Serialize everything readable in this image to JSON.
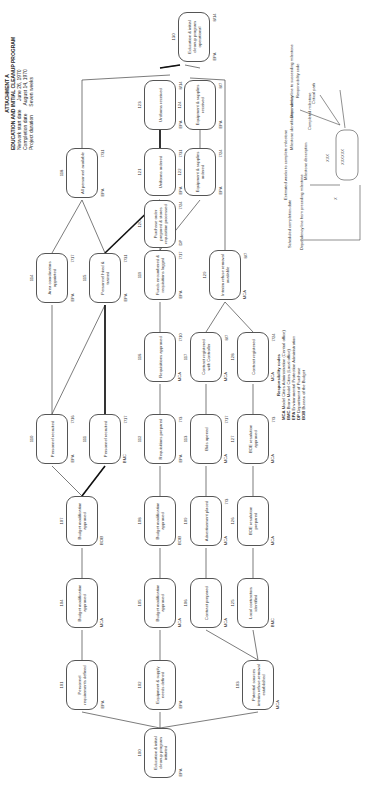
{
  "header": {
    "attachment": "ATTACHMENT A",
    "title": "EDUCATION AND INITIAL CLEANUP PROGRAM",
    "rows": [
      {
        "label": "Network start date",
        "value": "June 26, 1970"
      },
      {
        "label": "Completion date",
        "value": "August 14, 1970"
      },
      {
        "label": "Project duration",
        "value": "Seven weeks"
      }
    ]
  },
  "nodes": [
    {
      "id": "100",
      "desc": "Education & initial cleanup program initiated",
      "code": "EPA",
      "date": ""
    },
    {
      "id": "101",
      "desc": "Personnel requirements defined",
      "code": "EPA",
      "date": ""
    },
    {
      "id": "102",
      "desc": "Equipment & supply needs defined",
      "code": "EPA",
      "date": ""
    },
    {
      "id": "103",
      "desc": "Potential sources interim refuse-removal established",
      "code": "MCA",
      "date": ""
    },
    {
      "id": "104",
      "desc": "Budget modification approved",
      "code": "MCA",
      "date": ""
    },
    {
      "id": "105",
      "desc": "Budget modification approved",
      "code": "MCA",
      "date": ""
    },
    {
      "id": "106",
      "desc": "Contract prepared",
      "code": "MCA",
      "date": ""
    },
    {
      "id": "125",
      "desc": "Local contractors identified",
      "code": "BMC",
      "date": ""
    },
    {
      "id": "107",
      "desc": "Budget modification approved",
      "code": "BOB",
      "date": ""
    },
    {
      "id": "108",
      "desc": "Budget modification approved",
      "code": "BOB",
      "date": ""
    },
    {
      "id": "109",
      "desc": "Advertisement placed",
      "code": "MCA",
      "date": "7/3"
    },
    {
      "id": "126",
      "desc": "BOE resolution prepared",
      "code": "MCA",
      "date": ""
    },
    {
      "id": "110",
      "desc": "Personnel recruited",
      "code": "EPA",
      "date": "7/16"
    },
    {
      "id": "111",
      "desc": "Personnel recruited",
      "code": "BMC",
      "date": "7/17"
    },
    {
      "id": "112",
      "desc": "Requisitions prepared",
      "code": "EPA",
      "date": "7/3"
    },
    {
      "id": "113",
      "desc": "Bids opened",
      "code": "MCA",
      "date": "7/17"
    },
    {
      "id": "127",
      "desc": "BOE resolution approved",
      "code": "MCA",
      "date": "7/3"
    },
    {
      "id": "114",
      "desc": "Area coordinators appointed",
      "code": "EPA",
      "date": "7/17"
    },
    {
      "id": "115",
      "desc": "Personnel hired & trained",
      "code": "EPA",
      "date": "7/31"
    },
    {
      "id": "116",
      "desc": "Requisitions approved",
      "code": "MCA",
      "date": "7/10"
    },
    {
      "id": "117",
      "desc": "Contract registered with Controller",
      "code": "MCA",
      "date": "8/7"
    },
    {
      "id": "128",
      "desc": "Contract registered",
      "code": "MCA",
      "date": "7/24"
    },
    {
      "id": "119",
      "desc": "Funds encumbered & requisitions logged",
      "code": "EPA",
      "date": "7/17"
    },
    {
      "id": "129",
      "desc": "Interim refuse removal available",
      "code": "MCA",
      "date": "8/7"
    },
    {
      "id": "118",
      "desc": "All personnel available",
      "code": "EPA",
      "date": "7/31"
    },
    {
      "id": "120",
      "desc": "Purchase order prepared & stores requisition processed",
      "code": "DP",
      "date": "7/24"
    },
    {
      "id": "121",
      "desc": "Uniforms ordered",
      "code": "EPA",
      "date": "7/31"
    },
    {
      "id": "122",
      "desc": "Equipment & supplies ordered",
      "code": "EPA",
      "date": "7/24"
    },
    {
      "id": "123",
      "desc": "Uniforms received",
      "code": "EPA",
      "date": "8/14"
    },
    {
      "id": "124",
      "desc": "Equipment & supplies received",
      "code": "EPA",
      "date": "8/7"
    },
    {
      "id": "130",
      "desc": "Education & initial cleanup program operational",
      "code": "EPA",
      "date": "8/14"
    }
  ],
  "responsibility_codes": {
    "title": "Responsibility codes",
    "items": [
      {
        "code": "MCA",
        "name": "Model Cities Administration (Central office)"
      },
      {
        "code": "BMC",
        "name": "Bronx Model Cities (Local office)"
      },
      {
        "code": "EPA",
        "name": "Environmental Protection Administration"
      },
      {
        "code": "DP",
        "name": "Department of Purchase"
      },
      {
        "code": "BOB",
        "name": "Bureau of the Budget"
      }
    ]
  },
  "legend": {
    "scheduled_completion_date": "Scheduled completion date",
    "dependency_from_preceding": "Dependency line from preceding milestone",
    "estimated_weeks": "Estimated weeks to complete milestone",
    "milestone_description": "Milestone description",
    "milestone_id_number": "Milestone identification number",
    "completed_milestone": "Completed milestone",
    "dependency_to_succeeding": "Dependency line to succeeding milestone",
    "critical_path": "Critical path",
    "responsibility_code": "Responsibility code",
    "placeholder_x": "X",
    "placeholder_xxx": "XXX",
    "placeholder_desc": "XXXXXX"
  }
}
